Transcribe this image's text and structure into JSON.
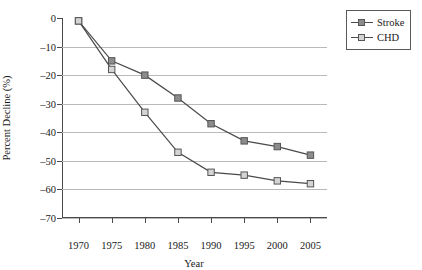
{
  "chart_data": {
    "type": "line",
    "title": "",
    "xlabel": "Year",
    "ylabel": "Percent Decline (%)",
    "x": [
      1970,
      1975,
      1980,
      1985,
      1990,
      1995,
      2000,
      2005
    ],
    "xtick_labels": [
      "1970",
      "1975",
      "1980",
      "1985",
      "1990",
      "1995",
      "2000",
      "2005"
    ],
    "ytick_labels": [
      "0",
      "–10",
      "–20",
      "–30",
      "–40",
      "–50",
      "–60",
      "–70"
    ],
    "ytick_values": [
      0,
      -10,
      -20,
      -30,
      -40,
      -50,
      -60,
      -70
    ],
    "ylim": [
      -70,
      0
    ],
    "xlim": [
      1967.5,
      2007.5
    ],
    "grid": "horizontal",
    "legend_position": "outside-top-right",
    "series": [
      {
        "name": "Stroke",
        "marker": "square-filled",
        "color": "#4a4a4a",
        "marker_fill": "#8c8c8c",
        "values": [
          -1,
          -15,
          -20,
          -28,
          -37,
          -43,
          -45,
          -48
        ]
      },
      {
        "name": "CHD",
        "marker": "square-open",
        "color": "#4a4a4a",
        "marker_fill": "#d4d4d4",
        "values": [
          -1,
          -18,
          -33,
          -47,
          -54,
          -55,
          -57,
          -58
        ]
      }
    ]
  },
  "legend": {
    "items": [
      {
        "label": "Stroke"
      },
      {
        "label": "CHD"
      }
    ]
  },
  "axes": {
    "x_title": "Year",
    "y_title": "Percent Decline (%)"
  },
  "colors": {
    "axis": "#4a4a4a",
    "grid": "#b9b9b9",
    "stroke_series": "#8c8c8c",
    "chd_series": "#d4d4d4",
    "line": "#4a4a4a",
    "background": "#ffffff"
  }
}
